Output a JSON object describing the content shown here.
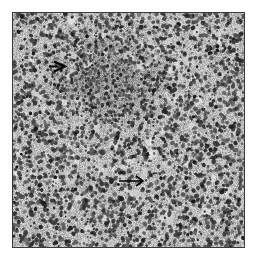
{
  "figure": {
    "type": "grayscale histology micrograph",
    "background_color": "#ffffff",
    "border_color": "#3a3a3a",
    "frame": {
      "x": 12,
      "y": 12,
      "width": 231,
      "height": 234
    }
  },
  "tissue": {
    "base_gray": 184,
    "seed": 1337,
    "nuclei_count": 5200,
    "dense_region": {
      "cx": 95,
      "cy": 62,
      "rx": 70,
      "ry": 55,
      "strength": 0.55
    },
    "light_patch_count": 260
  },
  "annotations": [
    {
      "id": "arrowhead-open",
      "kind": "open-arrowhead",
      "direction": "right",
      "x": 48,
      "y": 60,
      "width": 18,
      "height": 12,
      "color": "#000000"
    },
    {
      "id": "arrow-long",
      "kind": "line-arrow",
      "direction": "right",
      "x": 118,
      "y": 174,
      "width": 26,
      "height": 12,
      "color": "#000000"
    }
  ]
}
